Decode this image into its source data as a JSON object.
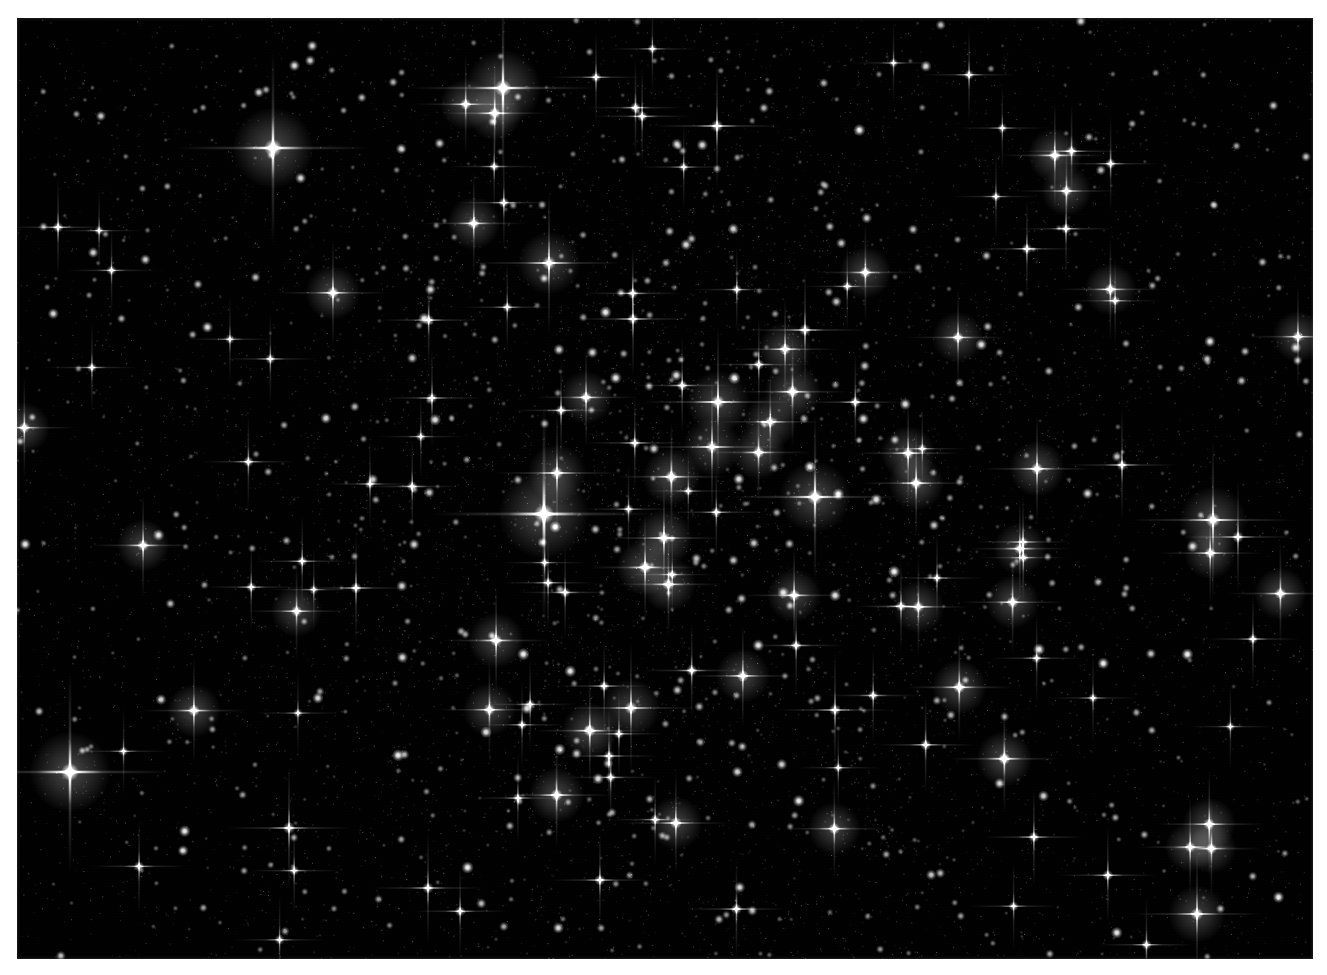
{
  "image": {
    "kind": "astronomical-photograph",
    "subject": "globular star cluster",
    "color_mode": "monochrome grayscale",
    "background_color": "#010101",
    "star_color": "#ffffff",
    "page_color": "#ffffff",
    "plate": {
      "x": 17,
      "y": 18,
      "width": 1296,
      "height": 941
    },
    "notes": "dense resolved stellar field with cross-shaped telescope diffraction spikes on the brightest stars"
  },
  "chart_data": {
    "type": "scatter",
    "title": "",
    "xlabel": "",
    "ylabel": "",
    "xlim": [
      0,
      1296
    ],
    "ylim": [
      0,
      941
    ],
    "grid": false,
    "legend": null,
    "core": {
      "cx": 660,
      "cy": 470,
      "core_radius": 330,
      "halo_radius": 560
    },
    "counts": {
      "bright_named_stars": 26,
      "field_stars_generated": 2400
    },
    "bright_stars": [
      {
        "x": 256,
        "y": 130,
        "brightness": 1.0,
        "r": 9.0,
        "spikes": true,
        "spike_len": 96
      },
      {
        "x": 486,
        "y": 70,
        "brightness": 1.0,
        "r": 8.5,
        "spikes": true,
        "spike_len": 92
      },
      {
        "x": 53,
        "y": 754,
        "brightness": 1.0,
        "r": 9.0,
        "spikes": true,
        "spike_len": 100
      },
      {
        "x": 527,
        "y": 496,
        "brightness": 1.0,
        "r": 10.0,
        "spikes": true,
        "spike_len": 110
      },
      {
        "x": 540,
        "y": 455,
        "brightness": 0.86,
        "r": 6.5,
        "spikes": true,
        "spike_len": 62
      },
      {
        "x": 798,
        "y": 479,
        "brightness": 0.95,
        "r": 8.0,
        "spikes": true,
        "spike_len": 84
      },
      {
        "x": 701,
        "y": 384,
        "brightness": 0.92,
        "r": 7.0,
        "spikes": true,
        "spike_len": 76
      },
      {
        "x": 695,
        "y": 429,
        "brightness": 0.88,
        "r": 6.5,
        "spikes": true,
        "spike_len": 70
      },
      {
        "x": 1196,
        "y": 502,
        "brightness": 0.93,
        "r": 7.5,
        "spikes": true,
        "spike_len": 80
      },
      {
        "x": 1221,
        "y": 519,
        "brightness": 0.8,
        "r": 6.0,
        "spikes": true,
        "spike_len": 56
      },
      {
        "x": 700,
        "y": 108,
        "brightness": 0.85,
        "r": 6.5,
        "spikes": true,
        "spike_len": 64
      },
      {
        "x": 532,
        "y": 245,
        "brightness": 0.88,
        "r": 7.0,
        "spikes": true,
        "spike_len": 72
      },
      {
        "x": 616,
        "y": 301,
        "brightness": 0.82,
        "r": 6.0,
        "spikes": true,
        "spike_len": 58
      },
      {
        "x": 788,
        "y": 312,
        "brightness": 0.84,
        "r": 6.2,
        "spikes": true,
        "spike_len": 60
      },
      {
        "x": 415,
        "y": 380,
        "brightness": 0.78,
        "r": 5.6,
        "spikes": true,
        "spike_len": 50
      },
      {
        "x": 339,
        "y": 570,
        "brightness": 0.8,
        "r": 5.8,
        "spikes": true,
        "spike_len": 54
      },
      {
        "x": 614,
        "y": 690,
        "brightness": 0.86,
        "r": 6.5,
        "spikes": true,
        "spike_len": 66
      },
      {
        "x": 818,
        "y": 692,
        "brightness": 0.82,
        "r": 6.0,
        "spikes": true,
        "spike_len": 58
      },
      {
        "x": 1105,
        "y": 447,
        "brightness": 0.8,
        "r": 5.8,
        "spikes": true,
        "spike_len": 56
      },
      {
        "x": 1180,
        "y": 896,
        "brightness": 0.86,
        "r": 6.4,
        "spikes": true,
        "spike_len": 64
      },
      {
        "x": 411,
        "y": 870,
        "brightness": 0.8,
        "r": 5.8,
        "spikes": true,
        "spike_len": 56
      },
      {
        "x": 272,
        "y": 810,
        "brightness": 0.84,
        "r": 6.2,
        "spikes": true,
        "spike_len": 62
      },
      {
        "x": 1006,
        "y": 524,
        "brightness": 0.78,
        "r": 5.4,
        "spikes": true,
        "spike_len": 48
      },
      {
        "x": 920,
        "y": 560,
        "brightness": 0.76,
        "r": 5.2,
        "spikes": true,
        "spike_len": 46
      },
      {
        "x": 353,
        "y": 466,
        "brightness": 0.74,
        "r": 5.0,
        "spikes": true,
        "spike_len": 44
      },
      {
        "x": 1076,
        "y": 680,
        "brightness": 0.74,
        "r": 5.0,
        "spikes": true,
        "spike_len": 44
      }
    ],
    "glow_patches": [
      {
        "x": 660,
        "y": 470,
        "radius": 420,
        "opacity": 0.14
      },
      {
        "x": 620,
        "y": 430,
        "radius": 250,
        "opacity": 0.1
      },
      {
        "x": 740,
        "y": 520,
        "radius": 220,
        "opacity": 0.08
      },
      {
        "x": 520,
        "y": 520,
        "radius": 180,
        "opacity": 0.07
      },
      {
        "x": 860,
        "y": 400,
        "radius": 190,
        "opacity": 0.06
      }
    ]
  }
}
